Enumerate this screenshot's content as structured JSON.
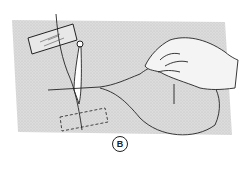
{
  "figure": {
    "label": "B",
    "colors": {
      "background": "#ffffff",
      "fabric": "#d9d9d9",
      "line": "#222222"
    },
    "elements": [
      "fabric-sheet",
      "tape-strip-top",
      "tape-strip-bottom-dashed",
      "needle",
      "suture-thread",
      "hand"
    ]
  }
}
